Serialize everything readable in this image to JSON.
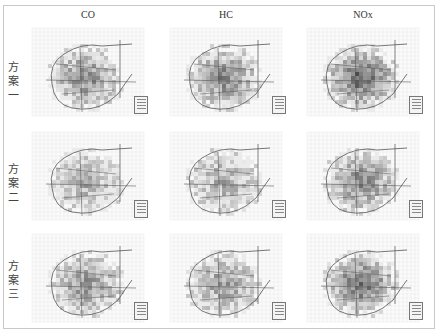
{
  "figure": {
    "columns": [
      {
        "label": "CO"
      },
      {
        "label": "HC"
      },
      {
        "label": "NOx"
      }
    ],
    "rows": [
      {
        "label": "方案一",
        "chars": [
          "方",
          "案",
          "一"
        ]
      },
      {
        "label": "方案二",
        "chars": [
          "方",
          "案",
          "二"
        ]
      },
      {
        "label": "方案三",
        "chars": [
          "方",
          "案",
          "三"
        ]
      }
    ],
    "panel_type": "grayscale gridded emission concentration map with road network",
    "legend_icon": "map-legend-box",
    "colors": {
      "background": "#ffffff",
      "frame": "#c9c9c9",
      "grid_light": "#e6e6e6",
      "cell_low": "#d9d9d9",
      "cell_mid": "#a0a0a0",
      "cell_high": "#4a4a4a",
      "road": "#555555"
    }
  }
}
